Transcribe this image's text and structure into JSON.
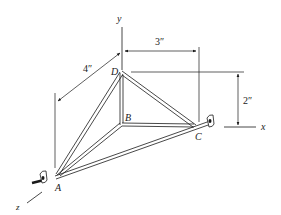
{
  "figure": {
    "axes": {
      "x": "x",
      "y": "y",
      "z": "z"
    },
    "points": {
      "A": "A",
      "B": "B",
      "C": "C",
      "D": "D"
    },
    "dimensions": {
      "width_x": "3″",
      "height_y": "2″",
      "depth_z": "4″"
    },
    "colors": {
      "ink": "#1a1a1a",
      "background": "#ffffff"
    }
  }
}
